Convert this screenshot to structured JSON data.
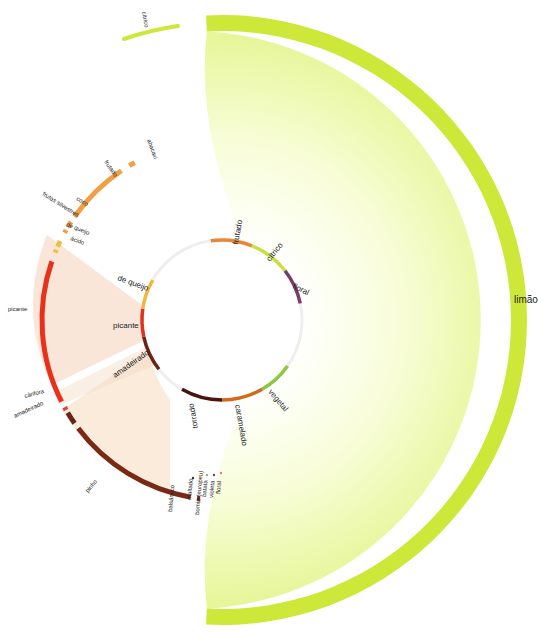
{
  "diagram": {
    "center": {
      "x": 222,
      "y": 320
    },
    "inner_ring": {
      "radius": 80,
      "segments": [
        {
          "label": "frutado",
          "start": -8,
          "end": 22,
          "color": "#E8873A"
        },
        {
          "label": "cítrico",
          "start": 22,
          "end": 52,
          "color": "#C8E040"
        },
        {
          "label": "floral",
          "start": 52,
          "end": 78,
          "color": "#7A3A6A"
        },
        {
          "label": "vegetal",
          "start": 125,
          "end": 150,
          "color": "#8DC63F"
        },
        {
          "label": "caramelado",
          "start": 150,
          "end": 180,
          "color": "#D2691E"
        },
        {
          "label": "torrado",
          "start": 180,
          "end": 210,
          "color": "#4A1410"
        },
        {
          "label": "amadeirado",
          "start": 232,
          "end": 258,
          "color": "#6B2418"
        },
        {
          "label": "picante",
          "start": 258,
          "end": 278,
          "color": "#E0301E"
        },
        {
          "label": "de queijo",
          "start": 278,
          "end": 300,
          "color": "#F0B840"
        }
      ]
    },
    "outer_left_ring": {
      "radius": 180,
      "segments": [
        {
          "label": "abacaxi",
          "start": 329,
          "end": 331,
          "color": "#F0A040"
        },
        {
          "label": "frutado",
          "start": 305,
          "end": 326,
          "color": "#F0A040"
        },
        {
          "label": "coco",
          "start": 301,
          "end": 303,
          "color": "#F0A040"
        },
        {
          "label": "frutas silvestres",
          "start": 299,
          "end": 300,
          "color": "#F0A040"
        },
        {
          "label": "de queijo",
          "start": 294,
          "end": 296,
          "color": "#F0C040"
        },
        {
          "label": "ácido",
          "start": 292,
          "end": 293,
          "color": "#F0C040"
        },
        {
          "label": "picante",
          "start": 243,
          "end": 289,
          "color": "#E8301A"
        },
        {
          "label": "cânfora",
          "start": 240,
          "end": 241,
          "color": "#E04040"
        },
        {
          "label": "amadeirado",
          "start": 235,
          "end": 239,
          "color": "#6B2418"
        },
        {
          "label": "pinho",
          "start": 190,
          "end": 233,
          "color": "#7A2A14"
        },
        {
          "label": "balsâmico",
          "start": 187,
          "end": 188,
          "color": "#7A2A14"
        }
      ]
    },
    "small_labels": [
      {
        "label": "maltado",
        "color": "#333333"
      },
      {
        "label": "bomto (europeu)",
        "color": "#E8A040"
      },
      {
        "label": "batata",
        "color": "#C0A060"
      },
      {
        "label": "violeta",
        "color": "#7A3A6A"
      },
      {
        "label": "floral",
        "color": "#D080A0"
      }
    ],
    "limao": {
      "label": "limão",
      "outer_radius": 305,
      "band_width": 16,
      "start": -3,
      "end": 183,
      "band_color": "#CDE838",
      "fill_color_outer": "#E8F8A0",
      "fill_color_inner": "#FFFFFF"
    },
    "citrico_top": {
      "label": "cítrico",
      "color": "#CDE838"
    }
  }
}
